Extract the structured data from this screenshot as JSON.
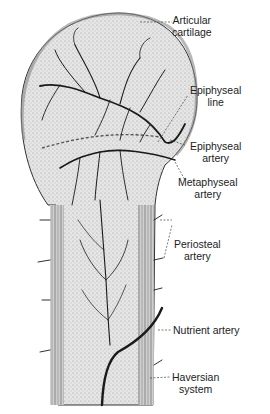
{
  "diagram": {
    "labels": {
      "articular_cartilage": [
        "Articular",
        "cartilage"
      ],
      "epiphyseal_line": [
        "Epiphyseal",
        "line"
      ],
      "epiphyseal_artery": [
        "Epiphyseal",
        "artery"
      ],
      "metaphyseal_artery": [
        "Metaphyseal",
        "artery"
      ],
      "periosteal_artery": [
        "Periosteal",
        "artery"
      ],
      "nutrient_artery": [
        "Nutrient artery"
      ],
      "haversian_system": [
        "Haversian",
        "system"
      ]
    },
    "colors": {
      "ink": "#1a1a1a",
      "stipple": "#d9d9d9",
      "background": "#ffffff"
    }
  }
}
